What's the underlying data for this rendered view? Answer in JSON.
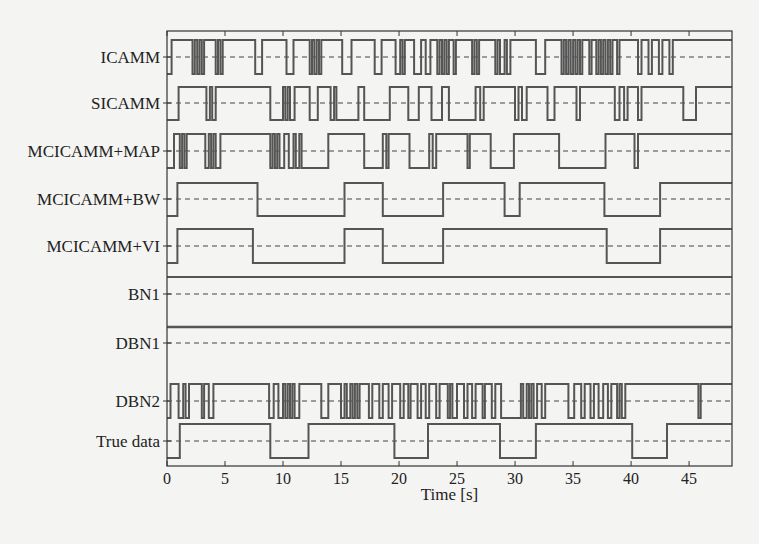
{
  "chart_data": {
    "type": "line",
    "subtype": "step / digital timing diagram",
    "title": "",
    "xlabel": "Time [s]",
    "ylabel": "",
    "xlim": [
      0,
      48.7
    ],
    "xticks": [
      0,
      5,
      10,
      15,
      20,
      25,
      30,
      35,
      40,
      45
    ],
    "grid": false,
    "legend": "none (row labels on left)",
    "series": [
      {
        "name": "ICAMM",
        "note": "rapidly switching; approximate segments",
        "steps": [
          [
            0,
            0
          ],
          [
            0.4,
            1
          ],
          [
            2.2,
            0
          ],
          [
            2.4,
            1
          ],
          [
            2.6,
            0
          ],
          [
            2.8,
            1
          ],
          [
            3.0,
            0
          ],
          [
            3.2,
            1
          ],
          [
            4.2,
            0
          ],
          [
            4.4,
            1
          ],
          [
            4.6,
            0
          ],
          [
            4.8,
            1
          ],
          [
            7.6,
            0
          ],
          [
            8.2,
            1
          ],
          [
            10.3,
            0
          ],
          [
            10.9,
            1
          ],
          [
            12.3,
            0
          ],
          [
            12.5,
            1
          ],
          [
            12.7,
            0
          ],
          [
            12.9,
            1
          ],
          [
            13.1,
            0
          ],
          [
            13.3,
            1
          ],
          [
            15.1,
            0
          ],
          [
            15.9,
            1
          ],
          [
            17.9,
            0
          ],
          [
            18.5,
            1
          ],
          [
            19.7,
            0
          ],
          [
            20.1,
            1
          ],
          [
            20.3,
            0
          ],
          [
            20.5,
            1
          ],
          [
            21.3,
            0
          ],
          [
            21.9,
            1
          ],
          [
            22.3,
            0
          ],
          [
            22.7,
            1
          ],
          [
            23.3,
            0
          ],
          [
            23.5,
            1
          ],
          [
            23.7,
            0
          ],
          [
            23.9,
            1
          ],
          [
            24.1,
            0
          ],
          [
            24.3,
            1
          ],
          [
            24.7,
            0
          ],
          [
            24.9,
            1
          ],
          [
            26.3,
            0
          ],
          [
            26.5,
            1
          ],
          [
            26.7,
            0
          ],
          [
            26.9,
            1
          ],
          [
            28.3,
            0
          ],
          [
            28.5,
            1
          ],
          [
            28.7,
            0
          ],
          [
            29.1,
            1
          ],
          [
            29.3,
            0
          ],
          [
            29.6,
            1
          ],
          [
            31.8,
            0
          ],
          [
            32.6,
            1
          ],
          [
            34.0,
            0
          ],
          [
            34.2,
            1
          ],
          [
            34.4,
            0
          ],
          [
            34.6,
            1
          ],
          [
            34.8,
            0
          ],
          [
            35.0,
            1
          ],
          [
            35.2,
            0
          ],
          [
            35.4,
            1
          ],
          [
            35.6,
            0
          ],
          [
            35.8,
            1
          ],
          [
            36.4,
            0
          ],
          [
            36.6,
            1
          ],
          [
            37.0,
            0
          ],
          [
            37.2,
            1
          ],
          [
            37.4,
            0
          ],
          [
            37.6,
            1
          ],
          [
            37.8,
            0
          ],
          [
            38.0,
            1
          ],
          [
            38.2,
            0
          ],
          [
            38.4,
            1
          ],
          [
            38.8,
            0
          ],
          [
            39.0,
            1
          ],
          [
            40.6,
            0
          ],
          [
            40.9,
            1
          ],
          [
            41.5,
            0
          ],
          [
            41.8,
            1
          ],
          [
            42.4,
            0
          ],
          [
            42.7,
            1
          ],
          [
            43.3,
            0
          ],
          [
            43.6,
            1
          ],
          [
            48.7,
            1
          ]
        ]
      },
      {
        "name": "SICAMM",
        "note": "approximate segments",
        "steps": [
          [
            0,
            0
          ],
          [
            1.0,
            1
          ],
          [
            3.4,
            0
          ],
          [
            3.7,
            1
          ],
          [
            3.9,
            0
          ],
          [
            4.2,
            1
          ],
          [
            8.9,
            0
          ],
          [
            10.0,
            1
          ],
          [
            10.2,
            0
          ],
          [
            10.4,
            1
          ],
          [
            10.6,
            0
          ],
          [
            11.0,
            1
          ],
          [
            12.3,
            0
          ],
          [
            13.0,
            1
          ],
          [
            14.1,
            0
          ],
          [
            14.4,
            1
          ],
          [
            14.6,
            0
          ],
          [
            16.5,
            1
          ],
          [
            17.0,
            0
          ],
          [
            19.2,
            1
          ],
          [
            20.8,
            0
          ],
          [
            21.7,
            1
          ],
          [
            22.8,
            0
          ],
          [
            23.7,
            1
          ],
          [
            24.3,
            0
          ],
          [
            26.6,
            1
          ],
          [
            27.0,
            0
          ],
          [
            27.3,
            1
          ],
          [
            30.0,
            0
          ],
          [
            30.3,
            1
          ],
          [
            30.6,
            0
          ],
          [
            31.0,
            1
          ],
          [
            32.8,
            0
          ],
          [
            33.4,
            1
          ],
          [
            35.3,
            0
          ],
          [
            35.6,
            1
          ],
          [
            38.6,
            0
          ],
          [
            39.0,
            1
          ],
          [
            39.4,
            0
          ],
          [
            39.7,
            1
          ],
          [
            40.6,
            0
          ],
          [
            40.9,
            1
          ],
          [
            44.5,
            0
          ],
          [
            45.6,
            1
          ],
          [
            48.7,
            1
          ]
        ]
      },
      {
        "name": "MCICAMM+MAP",
        "note": "approximate segments",
        "steps": [
          [
            0,
            0
          ],
          [
            0.6,
            1
          ],
          [
            1.1,
            0
          ],
          [
            1.3,
            1
          ],
          [
            1.5,
            0
          ],
          [
            1.7,
            1
          ],
          [
            3.3,
            0
          ],
          [
            3.6,
            1
          ],
          [
            3.8,
            0
          ],
          [
            4.0,
            1
          ],
          [
            4.2,
            0
          ],
          [
            4.6,
            1
          ],
          [
            8.9,
            0
          ],
          [
            9.1,
            1
          ],
          [
            9.3,
            0
          ],
          [
            9.5,
            1
          ],
          [
            9.7,
            0
          ],
          [
            10.1,
            1
          ],
          [
            10.5,
            0
          ],
          [
            10.9,
            1
          ],
          [
            11.1,
            0
          ],
          [
            11.4,
            1
          ],
          [
            11.6,
            0
          ],
          [
            13.9,
            1
          ],
          [
            17.0,
            0
          ],
          [
            18.6,
            1
          ],
          [
            18.9,
            0
          ],
          [
            19.1,
            1
          ],
          [
            20.9,
            0
          ],
          [
            22.6,
            1
          ],
          [
            22.9,
            0
          ],
          [
            23.2,
            1
          ],
          [
            25.9,
            0
          ],
          [
            26.1,
            1
          ],
          [
            27.9,
            0
          ],
          [
            29.9,
            1
          ],
          [
            33.8,
            0
          ],
          [
            37.8,
            1
          ],
          [
            40.3,
            0
          ],
          [
            40.6,
            1
          ],
          [
            48.7,
            1
          ]
        ]
      },
      {
        "name": "MCICAMM+BW",
        "steps": [
          [
            0,
            0
          ],
          [
            0.9,
            1
          ],
          [
            7.8,
            0
          ],
          [
            15.3,
            1
          ],
          [
            18.6,
            0
          ],
          [
            23.8,
            1
          ],
          [
            29.1,
            0
          ],
          [
            30.4,
            1
          ],
          [
            37.7,
            0
          ],
          [
            42.5,
            1
          ],
          [
            48.7,
            1
          ]
        ]
      },
      {
        "name": "MCICAMM+VI",
        "steps": [
          [
            0,
            0
          ],
          [
            0.9,
            1
          ],
          [
            7.4,
            0
          ],
          [
            15.3,
            1
          ],
          [
            18.6,
            0
          ],
          [
            23.8,
            1
          ],
          [
            37.9,
            0
          ],
          [
            42.5,
            1
          ],
          [
            48.7,
            1
          ]
        ]
      },
      {
        "name": "BN1",
        "note": "constant (flat line)",
        "steps": [
          [
            0,
            1
          ],
          [
            48.7,
            1
          ]
        ]
      },
      {
        "name": "DBN1",
        "note": "constant (flat line)",
        "steps": [
          [
            0,
            1
          ],
          [
            48.7,
            1
          ]
        ]
      },
      {
        "name": "DBN2",
        "note": "rapidly switching; approximate segments",
        "steps": [
          [
            0,
            0
          ],
          [
            0.3,
            1
          ],
          [
            1.0,
            0
          ],
          [
            1.4,
            1
          ],
          [
            1.6,
            0
          ],
          [
            1.9,
            1
          ],
          [
            3.0,
            0
          ],
          [
            3.2,
            1
          ],
          [
            3.6,
            0
          ],
          [
            4.0,
            1
          ],
          [
            8.8,
            0
          ],
          [
            9.2,
            1
          ],
          [
            9.6,
            0
          ],
          [
            10.0,
            1
          ],
          [
            10.2,
            0
          ],
          [
            10.4,
            1
          ],
          [
            10.6,
            0
          ],
          [
            10.8,
            1
          ],
          [
            11.0,
            0
          ],
          [
            11.4,
            1
          ],
          [
            13.3,
            0
          ],
          [
            13.9,
            1
          ],
          [
            15.0,
            0
          ],
          [
            15.3,
            1
          ],
          [
            15.5,
            0
          ],
          [
            15.8,
            1
          ],
          [
            16.0,
            0
          ],
          [
            16.2,
            1
          ],
          [
            16.4,
            0
          ],
          [
            16.6,
            1
          ],
          [
            17.4,
            0
          ],
          [
            17.7,
            1
          ],
          [
            18.3,
            0
          ],
          [
            18.6,
            1
          ],
          [
            19.1,
            0
          ],
          [
            19.4,
            1
          ],
          [
            20.1,
            0
          ],
          [
            20.4,
            1
          ],
          [
            20.8,
            0
          ],
          [
            21.0,
            1
          ],
          [
            21.6,
            0
          ],
          [
            21.9,
            1
          ],
          [
            22.3,
            0
          ],
          [
            22.6,
            1
          ],
          [
            23.2,
            0
          ],
          [
            23.5,
            1
          ],
          [
            24.2,
            0
          ],
          [
            24.4,
            1
          ],
          [
            24.6,
            0
          ],
          [
            25.0,
            1
          ],
          [
            25.6,
            0
          ],
          [
            25.9,
            1
          ],
          [
            26.3,
            0
          ],
          [
            26.6,
            1
          ],
          [
            27.2,
            0
          ],
          [
            27.4,
            1
          ],
          [
            28.0,
            0
          ],
          [
            28.3,
            1
          ],
          [
            28.8,
            0
          ],
          [
            30.5,
            1
          ],
          [
            30.7,
            0
          ],
          [
            31.0,
            1
          ],
          [
            31.2,
            0
          ],
          [
            31.4,
            1
          ],
          [
            31.6,
            0
          ],
          [
            31.9,
            1
          ],
          [
            32.3,
            0
          ],
          [
            32.6,
            1
          ],
          [
            34.6,
            0
          ],
          [
            35.1,
            1
          ],
          [
            35.7,
            0
          ],
          [
            36.0,
            1
          ],
          [
            36.5,
            0
          ],
          [
            36.8,
            1
          ],
          [
            37.2,
            0
          ],
          [
            37.6,
            1
          ],
          [
            38.0,
            0
          ],
          [
            38.3,
            1
          ],
          [
            38.8,
            0
          ],
          [
            39.0,
            1
          ],
          [
            39.2,
            0
          ],
          [
            39.5,
            1
          ],
          [
            45.8,
            0
          ],
          [
            46.0,
            1
          ],
          [
            48.7,
            1
          ]
        ]
      },
      {
        "name": "True data",
        "steps": [
          [
            0,
            0
          ],
          [
            1.1,
            1
          ],
          [
            8.9,
            0
          ],
          [
            12.2,
            1
          ],
          [
            19.6,
            0
          ],
          [
            22.5,
            1
          ],
          [
            28.7,
            0
          ],
          [
            31.8,
            1
          ],
          [
            40.1,
            0
          ],
          [
            43.1,
            1
          ],
          [
            48.7,
            1
          ]
        ]
      }
    ]
  },
  "labels": {
    "rows": [
      "ICAMM",
      "SICAMM",
      "MCICAMM+MAP",
      "MCICAMM+BW",
      "MCICAMM+VI",
      "BN1",
      "DBN1",
      "DBN2",
      "True data"
    ],
    "xlabel": "Time [s]",
    "xticks": [
      "0",
      "5",
      "10",
      "15",
      "20",
      "25",
      "30",
      "35",
      "40",
      "45"
    ]
  },
  "style": {
    "line_color": "#555555",
    "axis_color": "#333333",
    "background": "#f4f4f2"
  }
}
